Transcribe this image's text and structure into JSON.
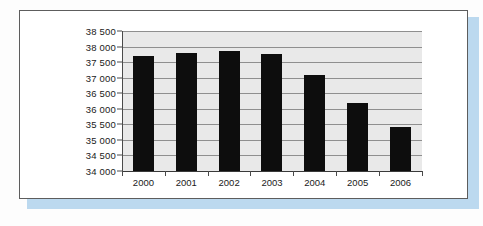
{
  "chart_data": {
    "type": "bar",
    "title": "",
    "subtitle": "",
    "xlabel": "",
    "ylabel": "",
    "categories": [
      "2000",
      "2001",
      "2002",
      "2003",
      "2004",
      "2005",
      "2006"
    ],
    "values": [
      37700,
      37800,
      37850,
      37750,
      37100,
      36200,
      35400
    ],
    "series": [
      {
        "name": "",
        "values": [
          37700,
          37800,
          37850,
          37750,
          37100,
          36200,
          35400
        ]
      }
    ],
    "ylim": [
      34000,
      38500
    ],
    "ytick_values": [
      38500,
      38000,
      37500,
      37000,
      36500,
      36000,
      35500,
      35000,
      34500,
      34000
    ],
    "ytick_labels": [
      "38 500",
      "38 000",
      "37 500",
      "37 000",
      "36 500",
      "36 000",
      "35 500",
      "35 000",
      "34 500",
      "34 000"
    ],
    "grid": true,
    "legend": false,
    "legend_position": "none",
    "bar_color": "#0d0d0d",
    "plot_background": "#e9e9e9",
    "gridline_color": "#8f8f8f",
    "axis_color": "#4a4a4a",
    "annotations": []
  },
  "figure": {
    "frame_border_color": "#5d5d5d",
    "card_background": "#ffffff",
    "shadow_color": "#bcd9ef",
    "page_background": "#fdfdfd"
  }
}
